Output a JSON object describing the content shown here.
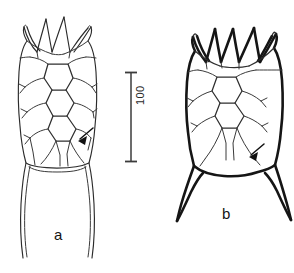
{
  "figure": {
    "kind": "scientific-line-drawing",
    "background_color": "#ffffff",
    "ink_color": "#151515",
    "width_px": 294,
    "height_px": 273
  },
  "scale_bar": {
    "name": "scale-bar",
    "value_label": "100",
    "orientation": "vertical",
    "bar_top_y": 72,
    "bar_bottom_y": 162,
    "bar_x": 131,
    "length_px": 90,
    "cap_style": "T-bar both ends",
    "label_rotation_deg": -90,
    "color": "#3b3b3b"
  },
  "specimens": [
    {
      "id": "a",
      "label": "a",
      "label_x": 54,
      "label_y": 227,
      "line_weight": "thin",
      "anterior_spines": 4,
      "posterior_form": "long tapering skirt with two trailing points",
      "plate_rows": 4,
      "has_annotation_arrow": true,
      "arrow_points_to": "posterior plate suture junction",
      "outline_color": "#2b2b2b"
    },
    {
      "id": "b",
      "label": "b",
      "label_x": 222,
      "label_y": 206,
      "line_weight": "bold",
      "anterior_spines": 4,
      "posterior_form": "two divergent pointed caudal spines",
      "plate_rows": 4,
      "has_annotation_arrow": true,
      "arrow_points_to": "posterior plate suture junction",
      "outline_color": "#151515"
    }
  ],
  "annotations": [
    {
      "name": "arrow-specimen-a",
      "tip_x": 78,
      "tip_y": 141,
      "tail_x": 93,
      "tail_y": 128,
      "direction": "down-left"
    },
    {
      "name": "arrow-specimen-b",
      "tip_x": 249,
      "tip_y": 157,
      "tail_x": 264,
      "tail_y": 144,
      "direction": "down-left"
    }
  ]
}
